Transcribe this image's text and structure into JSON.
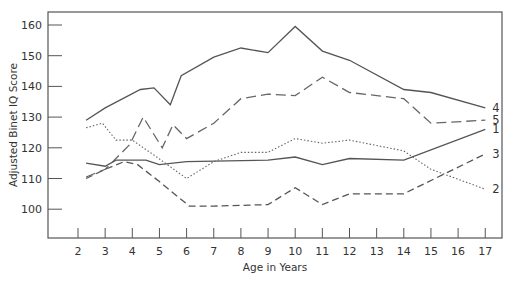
{
  "chart_data": {
    "type": "line",
    "title": "",
    "xlabel": "Age in Years",
    "ylabel": "Adjusted Binet IQ Score",
    "xlim": [
      1,
      17.6
    ],
    "ylim": [
      92,
      164
    ],
    "x_ticks": [
      2,
      3,
      4,
      5,
      6,
      7,
      8,
      9,
      10,
      11,
      12,
      13,
      14,
      15,
      16,
      17
    ],
    "y_ticks": [
      100,
      110,
      120,
      130,
      140,
      150,
      160
    ],
    "grid": false,
    "legend": "inline labels at right end of each line",
    "series": [
      {
        "name": "1",
        "style": "solid",
        "color": "#555555",
        "points": [
          [
            2.3,
            115
          ],
          [
            3,
            114
          ],
          [
            3.4,
            116
          ],
          [
            4.5,
            116
          ],
          [
            5,
            114.5
          ],
          [
            6,
            115.5
          ],
          [
            9,
            116
          ],
          [
            10,
            117
          ],
          [
            11,
            114.5
          ],
          [
            12,
            116.5
          ],
          [
            14,
            116
          ],
          [
            17,
            126
          ]
        ]
      },
      {
        "name": "2",
        "style": "dotted",
        "color": "#666666",
        "points": [
          [
            2.3,
            126.5
          ],
          [
            2.9,
            128
          ],
          [
            3.4,
            122.5
          ],
          [
            4,
            122.5
          ],
          [
            4.9,
            117
          ],
          [
            6,
            110
          ],
          [
            7,
            115.5
          ],
          [
            8,
            118.5
          ],
          [
            9,
            118.5
          ],
          [
            10,
            123
          ],
          [
            11,
            121.5
          ],
          [
            12,
            122.5
          ],
          [
            14,
            119
          ],
          [
            15,
            113
          ],
          [
            17,
            106.5
          ]
        ]
      },
      {
        "name": "3",
        "style": "dashed",
        "color": "#555555",
        "points": [
          [
            2.3,
            110
          ],
          [
            3,
            113
          ],
          [
            3.7,
            115.5
          ],
          [
            4.2,
            114.5
          ],
          [
            5,
            109
          ],
          [
            6.1,
            101
          ],
          [
            7,
            101
          ],
          [
            9,
            101.5
          ],
          [
            10,
            107
          ],
          [
            11,
            101.5
          ],
          [
            12,
            105
          ],
          [
            14,
            105
          ],
          [
            17,
            118
          ]
        ]
      },
      {
        "name": "4",
        "style": "solid",
        "color": "#555555",
        "points": [
          [
            2.3,
            129
          ],
          [
            3,
            133
          ],
          [
            4.3,
            139
          ],
          [
            4.8,
            139.5
          ],
          [
            5.4,
            134
          ],
          [
            5.8,
            143.5
          ],
          [
            7,
            149.5
          ],
          [
            8,
            152.5
          ],
          [
            9,
            151
          ],
          [
            10,
            159.5
          ],
          [
            11,
            151.5
          ],
          [
            12,
            148.5
          ],
          [
            14,
            139
          ],
          [
            15,
            138
          ],
          [
            17,
            133
          ]
        ]
      },
      {
        "name": "5",
        "style": "long-dash",
        "color": "#666666",
        "points": [
          [
            2.3,
            110.5
          ],
          [
            3,
            113
          ],
          [
            3.9,
            121
          ],
          [
            4.4,
            130
          ],
          [
            5.1,
            120
          ],
          [
            5.5,
            127.5
          ],
          [
            6,
            123
          ],
          [
            7,
            128
          ],
          [
            8,
            136
          ],
          [
            9,
            137.5
          ],
          [
            10,
            137
          ],
          [
            11,
            143
          ],
          [
            12,
            138
          ],
          [
            14,
            136
          ],
          [
            15,
            128
          ],
          [
            17,
            129
          ]
        ]
      }
    ]
  }
}
